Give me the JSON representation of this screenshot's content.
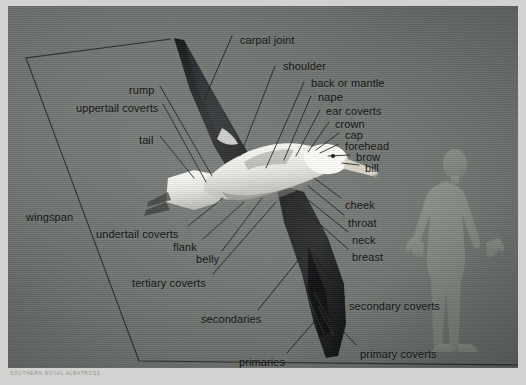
{
  "figure": {
    "subject": "Southern Royal Albatross",
    "caption": "SOUTHERN ROYAL ALBATROSS",
    "background_color": "#747975",
    "label_color": "#141414",
    "leader_line_color": "#1b1b1b",
    "wingspan_outline_color": "#33312e",
    "human_silhouette_color": "#8e938d"
  },
  "labels": [
    {
      "id": "carpal-joint",
      "text": "carpal joint",
      "x": 232,
      "y": 28,
      "anchor": "left"
    },
    {
      "id": "shoulder",
      "text": "shoulder",
      "x": 275,
      "y": 54,
      "anchor": "left"
    },
    {
      "id": "back-or-mantle",
      "text": "back or mantle",
      "x": 303,
      "y": 71,
      "anchor": "left"
    },
    {
      "id": "nape",
      "text": "nape",
      "x": 310,
      "y": 85,
      "anchor": "left"
    },
    {
      "id": "ear-coverts",
      "text": "ear coverts",
      "x": 318,
      "y": 99,
      "anchor": "left"
    },
    {
      "id": "crown",
      "text": "crown",
      "x": 327,
      "y": 112,
      "anchor": "left"
    },
    {
      "id": "cap",
      "text": "cap",
      "x": 337,
      "y": 123,
      "anchor": "left"
    },
    {
      "id": "forehead",
      "text": "forehead",
      "x": 337,
      "y": 134,
      "anchor": "left"
    },
    {
      "id": "brow",
      "text": "brow",
      "x": 348,
      "y": 145,
      "anchor": "left"
    },
    {
      "id": "bill",
      "text": "bill",
      "x": 357,
      "y": 156,
      "anchor": "left"
    },
    {
      "id": "cheek",
      "text": "cheek",
      "x": 337,
      "y": 193,
      "anchor": "left"
    },
    {
      "id": "throat",
      "text": "throat",
      "x": 340,
      "y": 211,
      "anchor": "left"
    },
    {
      "id": "neck",
      "text": "neck",
      "x": 344,
      "y": 228,
      "anchor": "left"
    },
    {
      "id": "breast",
      "text": "breast",
      "x": 344,
      "y": 245,
      "anchor": "left"
    },
    {
      "id": "secondary-coverts",
      "text": "secondary coverts",
      "x": 341,
      "y": 294,
      "anchor": "left"
    },
    {
      "id": "primary-coverts",
      "text": "primary coverts",
      "x": 352,
      "y": 342,
      "anchor": "left"
    },
    {
      "id": "rump",
      "text": "rump",
      "x": 121,
      "y": 78,
      "anchor": "left"
    },
    {
      "id": "uppertail-coverts",
      "text": "uppertail coverts",
      "x": 68,
      "y": 96,
      "anchor": "left"
    },
    {
      "id": "tail",
      "text": "tail",
      "x": 131,
      "y": 128,
      "anchor": "left"
    },
    {
      "id": "wingspan",
      "text": "wingspan",
      "x": 18,
      "y": 205,
      "anchor": "left"
    },
    {
      "id": "undertail-coverts",
      "text": "undertail coverts",
      "x": 88,
      "y": 222,
      "anchor": "left"
    },
    {
      "id": "flank",
      "text": "flank",
      "x": 165,
      "y": 235,
      "anchor": "left"
    },
    {
      "id": "belly",
      "text": "belly",
      "x": 188,
      "y": 247,
      "anchor": "left"
    },
    {
      "id": "tertiary-coverts",
      "text": "tertiary coverts",
      "x": 124,
      "y": 271,
      "anchor": "left"
    },
    {
      "id": "secondaries",
      "text": "secondaries",
      "x": 193,
      "y": 307,
      "anchor": "left"
    },
    {
      "id": "primaries",
      "text": "primaries",
      "x": 231,
      "y": 350,
      "anchor": "left"
    }
  ]
}
